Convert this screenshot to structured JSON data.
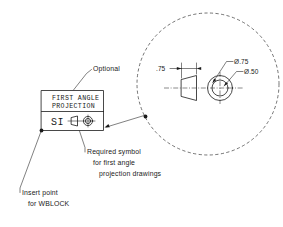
{
  "drawing": {
    "title_block": {
      "line1": "FIRST ANGLE",
      "line2": "PROJECTION",
      "si_label": "SI",
      "symbol_name": "first-angle-projection-symbol"
    },
    "annotations": [
      {
        "id": "optional",
        "text": "Optional"
      },
      {
        "id": "required-symbol-1",
        "text": "Required symbol"
      },
      {
        "id": "required-symbol-2",
        "text": "for first angle"
      },
      {
        "id": "required-symbol-3",
        "text": "projection drawings"
      },
      {
        "id": "insert-point-1",
        "text": "Insert point"
      },
      {
        "id": "insert-point-2",
        "text": "for WBLOCK"
      }
    ],
    "detail_view": {
      "balloon_name": "detail-balloon-circle",
      "dimensions": [
        {
          "id": "width-dim",
          "text": ".75"
        },
        {
          "id": "outer-dia",
          "text": "Ø.75"
        },
        {
          "id": "inner-dia",
          "text": "Ø.50"
        }
      ]
    },
    "colors": {
      "line": "#1a1a1a",
      "background": "#ffffff",
      "construction": "#3a3a3a"
    }
  }
}
